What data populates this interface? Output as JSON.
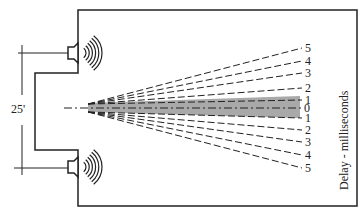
{
  "diagram": {
    "dimension_label": "25'",
    "axis_label": "Delay - milliseconds",
    "upper_delay_labels": [
      "5",
      "4",
      "3",
      "2",
      "1"
    ],
    "center_label": "0",
    "lower_delay_labels": [
      "1",
      "2",
      "3",
      "4",
      "5"
    ],
    "colors": {
      "line": "#222222",
      "band": "#9a9a9a"
    },
    "speakers": [
      {
        "name": "upper-speaker"
      },
      {
        "name": "lower-speaker"
      }
    ]
  }
}
